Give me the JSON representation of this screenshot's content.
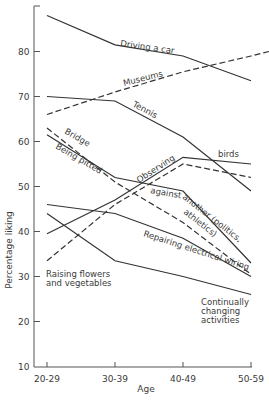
{
  "chart_data": {
    "type": "line",
    "title": "",
    "xlabel": "Age",
    "ylabel": "Percentage liking",
    "categories": [
      "20-29",
      "30-39",
      "40-49",
      "50-59"
    ],
    "yticks": [
      10,
      20,
      30,
      40,
      50,
      60,
      70,
      80
    ],
    "ylim": [
      10,
      90
    ],
    "grid": false,
    "legend": "inline labels",
    "series": [
      {
        "name": "Driving a car",
        "style": "solid",
        "values": [
          88,
          81.5,
          79,
          73.5
        ]
      },
      {
        "name": "Museums",
        "style": "dashed",
        "values": [
          66,
          71,
          75.5,
          79
        ]
      },
      {
        "name": "Tennis",
        "style": "solid",
        "values": [
          70,
          69,
          61,
          49
        ]
      },
      {
        "name": "Bridge",
        "style": "dashed",
        "values": [
          63,
          51,
          42,
          30.5
        ]
      },
      {
        "name": "Being pitted against another (politics, athletics)",
        "style": "solid",
        "values": [
          61.5,
          52,
          49,
          33
        ]
      },
      {
        "name": "Observing birds",
        "style": "solid",
        "values": [
          39.5,
          47,
          56.5,
          55
        ]
      },
      {
        "name": "Raising flowers and vegetables",
        "style": "dashed",
        "values": [
          33.5,
          46,
          55,
          52
        ]
      },
      {
        "name": "Repairing electrical wiring",
        "style": "solid",
        "values": [
          46,
          44,
          38.5,
          30
        ]
      },
      {
        "name": "Continually changing activities",
        "style": "solid",
        "values": [
          44,
          33.5,
          30,
          26
        ]
      }
    ]
  },
  "labels": {
    "driving": "Driving a car",
    "museums": "Museums",
    "tennis": "Tennis",
    "bridge": "Bridge",
    "being_pitted": "Being pitted",
    "observing": "Observing",
    "birds": "birds",
    "against": "against",
    "another_politics": "another (politics,",
    "athletics": "athletics)",
    "repairing": "Repairing electrical wiring",
    "raising_1": "Raising flowers",
    "raising_2": "and vegetables",
    "continually_1": "Continually",
    "continually_2": "changing",
    "continually_3": "activities"
  },
  "axes": {
    "ylabel": "Percentage liking",
    "xlabel": "Age",
    "y_ticks": [
      "80",
      "70",
      "60",
      "50",
      "40",
      "30",
      "20",
      "10"
    ],
    "x_ticks": [
      "20-29",
      "30-39",
      "40-49",
      "50-59"
    ]
  }
}
